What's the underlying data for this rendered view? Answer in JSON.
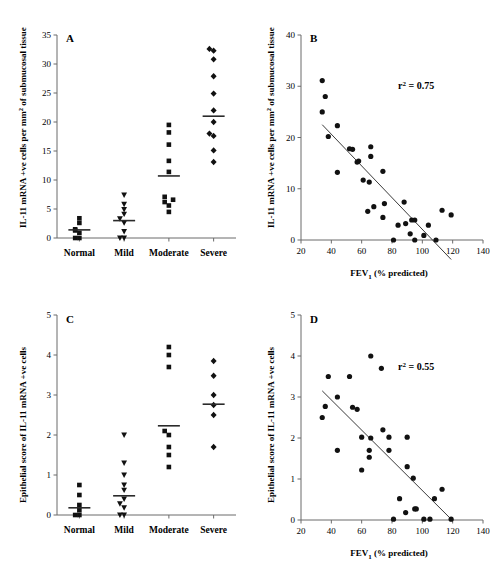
{
  "figure": {
    "background": "#ffffff",
    "marker_color": "#111111",
    "axis_color": "#6b6b6b"
  },
  "chart_data": [
    {
      "id": "A",
      "panel_letter": "A",
      "type": "scatter",
      "subtype": "categorical-dotplot",
      "title": "",
      "xlabel": "",
      "ylabel": "IL-11 mRNA +ve cells per mm² of submucosal tissue",
      "ylabel_parts": {
        "pre": "IL-11 mRNA +ve cells per mm",
        "sup": "2",
        "post": " of submucosal tissue"
      },
      "ylim": [
        0,
        35
      ],
      "yticks": [
        0,
        5,
        10,
        15,
        20,
        25,
        30,
        35
      ],
      "ytick_labels": [
        "0",
        "5",
        "10",
        "15",
        "20",
        "25",
        "30",
        "35"
      ],
      "grid": false,
      "legend": "none",
      "categories": [
        "Normal",
        "Mild",
        "Moderate",
        "Severe"
      ],
      "groups": [
        {
          "name": "Normal",
          "marker": "square",
          "median": 1.4,
          "values": [
            0.0,
            0.0,
            0.9,
            1.3,
            1.5,
            2.6,
            3.4
          ]
        },
        {
          "name": "Mild",
          "marker": "triangle-down",
          "median": 3.0,
          "values": [
            0.0,
            0.0,
            1.1,
            2.6,
            3.3,
            4.1,
            4.9,
            5.8,
            7.4
          ]
        },
        {
          "name": "Moderate",
          "marker": "square",
          "median": 10.7,
          "values": [
            4.5,
            5.6,
            6.2,
            6.6,
            7.1,
            11.4,
            13.3,
            16.1,
            18.2,
            19.5
          ]
        },
        {
          "name": "Severe",
          "marker": "diamond",
          "median": 21.0,
          "values": [
            13.1,
            15.1,
            17.6,
            18.0,
            20.0,
            22.0,
            24.9,
            27.9,
            30.8,
            32.3,
            32.6
          ]
        }
      ]
    },
    {
      "id": "B",
      "panel_letter": "B",
      "type": "scatter",
      "title": "",
      "xlabel": "FEV1 (% predicted)",
      "xlabel_parts": {
        "pre": "FEV",
        "sub": "1",
        "post": " (% predicted)"
      },
      "ylabel": "IL-11 mRNA +ve cells per mm² of submucosal tissue",
      "ylabel_parts": {
        "pre": "IL-11 mRNA +ve cells per mm",
        "sup": "2",
        "post": " of submucosal tissue"
      },
      "xlim": [
        20,
        140
      ],
      "ylim": [
        0,
        40
      ],
      "xticks": [
        20,
        40,
        60,
        80,
        100,
        120,
        140
      ],
      "xtick_labels": [
        "20",
        "40",
        "60",
        "80",
        "100",
        "120",
        "140"
      ],
      "yticks": [
        0,
        10,
        20,
        30,
        40
      ],
      "ytick_labels": [
        "0",
        "10",
        "20",
        "30",
        "40"
      ],
      "grid": false,
      "legend": "none",
      "annotation": "r² = 0.75",
      "annotation_parts": {
        "pre": "r",
        "sup": "2",
        "post": " = 0.75"
      },
      "r_squared": 0.75,
      "marker": "circle",
      "fit_line": {
        "x": [
          34,
          119
        ],
        "y": [
          22.5,
          -3.8
        ]
      },
      "points": [
        [
          34,
          31.1
        ],
        [
          36,
          28.0
        ],
        [
          34,
          25.0
        ],
        [
          44,
          22.3
        ],
        [
          38,
          20.2
        ],
        [
          52,
          17.8
        ],
        [
          54,
          17.7
        ],
        [
          66,
          18.2
        ],
        [
          66,
          16.3
        ],
        [
          58,
          15.4
        ],
        [
          57,
          15.2
        ],
        [
          44,
          13.2
        ],
        [
          74,
          13.4
        ],
        [
          61,
          11.7
        ],
        [
          65,
          11.3
        ],
        [
          64,
          5.6
        ],
        [
          68,
          6.5
        ],
        [
          75,
          7.1
        ],
        [
          88,
          7.4
        ],
        [
          74,
          4.4
        ],
        [
          84,
          2.9
        ],
        [
          89,
          3.2
        ],
        [
          93,
          3.9
        ],
        [
          95,
          3.9
        ],
        [
          104,
          2.9
        ],
        [
          92,
          1.2
        ],
        [
          101,
          0.9
        ],
        [
          95,
          0.0
        ],
        [
          81,
          0.0
        ],
        [
          109,
          0.0
        ],
        [
          113,
          5.8
        ],
        [
          119,
          4.9
        ]
      ]
    },
    {
      "id": "C",
      "panel_letter": "C",
      "type": "scatter",
      "subtype": "categorical-dotplot",
      "title": "",
      "xlabel": "",
      "ylabel": "Epithelial score of IL-11 mRNA +ve cells",
      "ylim": [
        0,
        5
      ],
      "yticks": [
        0,
        1,
        2,
        3,
        4,
        5
      ],
      "ytick_labels": [
        "0",
        "1",
        "2",
        "3",
        "4",
        "5"
      ],
      "grid": false,
      "legend": "none",
      "categories": [
        "Normal",
        "Mild",
        "Moderate",
        "Severe"
      ],
      "groups": [
        {
          "name": "Normal",
          "marker": "square",
          "median": 0.18,
          "values": [
            0.0,
            0.0,
            0.12,
            0.25,
            0.5,
            0.75
          ]
        },
        {
          "name": "Mild",
          "marker": "triangle-down",
          "median": 0.48,
          "values": [
            0.0,
            0.0,
            0.18,
            0.28,
            0.4,
            0.62,
            0.75,
            1.0,
            1.3,
            2.0
          ]
        },
        {
          "name": "Moderate",
          "marker": "square",
          "median": 2.23,
          "values": [
            1.2,
            1.5,
            1.7,
            2.0,
            2.1,
            3.7,
            4.0,
            4.2
          ]
        },
        {
          "name": "Severe",
          "marker": "diamond",
          "median": 2.77,
          "values": [
            1.7,
            2.5,
            2.75,
            3.0,
            3.48,
            3.85
          ]
        }
      ]
    },
    {
      "id": "D",
      "panel_letter": "D",
      "type": "scatter",
      "title": "",
      "xlabel": "FEV1 (% predicted)",
      "xlabel_parts": {
        "pre": "FEV",
        "sub": "1",
        "post": " (% predicted)"
      },
      "ylabel": "Epithelial score of IL-11 mRNA +ve cells",
      "xlim": [
        20,
        140
      ],
      "ylim": [
        0,
        5
      ],
      "xticks": [
        20,
        40,
        60,
        80,
        100,
        120,
        140
      ],
      "xtick_labels": [
        "20",
        "40",
        "60",
        "80",
        "100",
        "120",
        "140"
      ],
      "yticks": [
        0,
        1,
        2,
        3,
        4,
        5
      ],
      "ytick_labels": [
        "0",
        "1",
        "2",
        "3",
        "4",
        "5"
      ],
      "grid": false,
      "legend": "none",
      "annotation": "r² = 0.55",
      "annotation_parts": {
        "pre": "r",
        "sup": "2",
        "post": " = 0.55"
      },
      "r_squared": 0.55,
      "marker": "circle",
      "fit_line": {
        "x": [
          34,
          119
        ],
        "y": [
          3.15,
          0.02
        ]
      },
      "points": [
        [
          38,
          3.5
        ],
        [
          52,
          3.5
        ],
        [
          66,
          4.0
        ],
        [
          73,
          3.7
        ],
        [
          44,
          3.0
        ],
        [
          36,
          2.77
        ],
        [
          34,
          2.5
        ],
        [
          54,
          2.75
        ],
        [
          57,
          2.7
        ],
        [
          74,
          2.2
        ],
        [
          60,
          2.02
        ],
        [
          66,
          2.0
        ],
        [
          78,
          2.02
        ],
        [
          90,
          2.02
        ],
        [
          44,
          1.7
        ],
        [
          65,
          1.7
        ],
        [
          78,
          1.7
        ],
        [
          65,
          1.53
        ],
        [
          60,
          1.22
        ],
        [
          90,
          1.3
        ],
        [
          94,
          1.02
        ],
        [
          113,
          0.75
        ],
        [
          85,
          0.52
        ],
        [
          108,
          0.52
        ],
        [
          95,
          0.27
        ],
        [
          96,
          0.27
        ],
        [
          89,
          0.18
        ],
        [
          81,
          0.02
        ],
        [
          101,
          0.02
        ],
        [
          105,
          0.02
        ],
        [
          119,
          0.02
        ]
      ]
    }
  ]
}
